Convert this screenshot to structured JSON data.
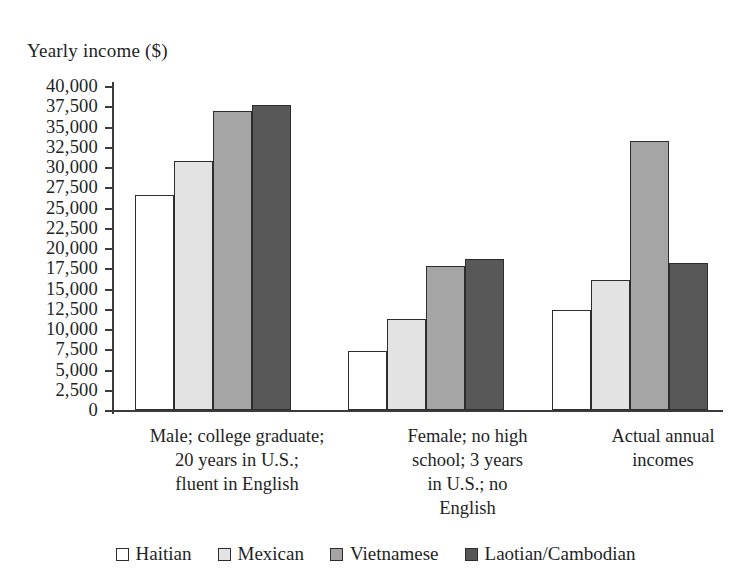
{
  "chart_data": {
    "type": "bar",
    "title": "",
    "ylabel": "Yearly income ($)",
    "xlabel": "",
    "ylim": [
      0,
      40000
    ],
    "ytick_step": 2500,
    "grid": false,
    "legend_position": "bottom",
    "ytick_labels": [
      "40,000",
      "37,500",
      "35,000",
      "32,500",
      "30,000",
      "27,500",
      "25,000",
      "22,500",
      "20,000",
      "17,500",
      "15,000",
      "12,500",
      "10,000",
      "7,500",
      "5,000",
      "2,500",
      "0"
    ],
    "ytick_values": [
      40000,
      37500,
      35000,
      32500,
      30000,
      27500,
      25000,
      22500,
      20000,
      17500,
      15000,
      12500,
      10000,
      7500,
      5000,
      2500,
      0
    ],
    "categories": [
      "Male; college graduate;\n20 years in U.S.;\nfluent in English",
      "Female; no high\nschool; 3 years\nin U.S.; no\nEnglish",
      "Actual annual\nincomes"
    ],
    "category_lines": [
      [
        "Male; college graduate;",
        "20 years in U.S.;",
        "fluent in English"
      ],
      [
        "Female; no high",
        "school; 3 years",
        "in U.S.; no",
        "English"
      ],
      [
        "Actual annual",
        "incomes"
      ]
    ],
    "series": [
      {
        "name": "Haitian",
        "color": "#ffffff",
        "values": [
          26500,
          7300,
          12400
        ]
      },
      {
        "name": "Mexican",
        "color": "#e3e3e3",
        "values": [
          30800,
          11200,
          16100
        ]
      },
      {
        "name": "Vietnamese",
        "color": "#a5a5a5",
        "values": [
          36900,
          17800,
          33200
        ]
      },
      {
        "name": "Laotian/Cambodian",
        "color": "#585858",
        "values": [
          37600,
          18600,
          18100
        ]
      }
    ]
  },
  "legend": {
    "items": [
      {
        "label": "Haitian",
        "swatch": "legend-swatch-haitian"
      },
      {
        "label": "Mexican",
        "swatch": "legend-swatch-mexican"
      },
      {
        "label": "Vietnamese",
        "swatch": "legend-swatch-vietnamese"
      },
      {
        "label": "Laotian/Cambodian",
        "swatch": "legend-swatch-laotian"
      }
    ]
  }
}
